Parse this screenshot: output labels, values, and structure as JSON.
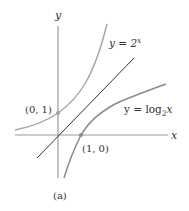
{
  "figure": {
    "caption": "(a)",
    "axes": {
      "x_label": "x",
      "y_label": "y"
    },
    "curves": [
      {
        "name": "exponential",
        "label_lhs": "y = 2",
        "label_exp": "x",
        "color": "#a8a8a8"
      },
      {
        "name": "logarithm",
        "label_lhs": "y = log",
        "label_sub": "2",
        "label_var": "x",
        "color": "#8a8a8a"
      },
      {
        "name": "identity-line",
        "label": "y = x",
        "color": "#333333"
      }
    ],
    "points": [
      {
        "name": "point-0-1",
        "label": "(0, 1)",
        "color": "#a0a0a0"
      },
      {
        "name": "point-1-0",
        "label": "(1, 0)",
        "color": "#8a8a8a"
      }
    ],
    "colors": {
      "axis": "#9a9a9a",
      "text": "#333333"
    }
  }
}
